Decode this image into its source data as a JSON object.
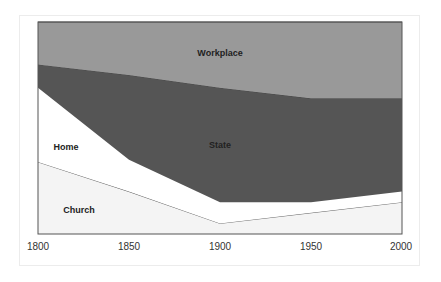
{
  "chart_data": {
    "type": "area",
    "stacked": true,
    "title": "",
    "xlabel": "",
    "ylabel": "",
    "x": [
      1800,
      1850,
      1900,
      1950,
      2000
    ],
    "categories": [
      "1800",
      "1850",
      "1900",
      "1950",
      "2000"
    ],
    "ylim": [
      0,
      100
    ],
    "grid": false,
    "legend": "none (labels placed inside areas)",
    "series": [
      {
        "name": "Church",
        "color": "#f4f4f4",
        "values": [
          34,
          20,
          5,
          10,
          15
        ]
      },
      {
        "name": "Home",
        "color": "#ffffff",
        "values": [
          35,
          15,
          10,
          5,
          5
        ]
      },
      {
        "name": "State",
        "color": "#555555",
        "values": [
          11,
          40,
          54,
          49,
          44
        ]
      },
      {
        "name": "Workplace",
        "color": "#999999",
        "values": [
          20,
          25,
          31,
          36,
          36
        ]
      }
    ],
    "cumulative_tops": {
      "Church": [
        34,
        20,
        5,
        10,
        15
      ],
      "Home": [
        69,
        35,
        15,
        15,
        20
      ],
      "State": [
        80,
        75,
        69,
        64,
        64
      ],
      "Workplace": [
        100,
        100,
        100,
        100,
        100
      ]
    }
  },
  "labels": {
    "workplace": "Workplace",
    "state": "State",
    "home": "Home",
    "church": "Church"
  },
  "axis": {
    "x_ticks": [
      "1800",
      "1850",
      "1900",
      "1950",
      "2000"
    ]
  }
}
